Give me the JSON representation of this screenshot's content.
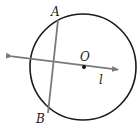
{
  "diagram": {
    "type": "geometry",
    "circle": {
      "cx": 83,
      "cy": 67,
      "r": 53,
      "stroke": "#1a1a1a"
    },
    "center_point": {
      "label": "O",
      "x": 84,
      "y": 67
    },
    "line": {
      "label": "l",
      "x1": 9,
      "y1": 56,
      "x2": 121,
      "y2": 70,
      "color": "#7a7a7a"
    },
    "chord": {
      "endpoints": [
        "A",
        "B"
      ],
      "x1": 58,
      "y1": 20,
      "x2": 48,
      "y2": 113,
      "color": "#7a7a7a"
    },
    "labels": {
      "A": "A",
      "B": "B",
      "O": "O",
      "l": "l"
    }
  }
}
